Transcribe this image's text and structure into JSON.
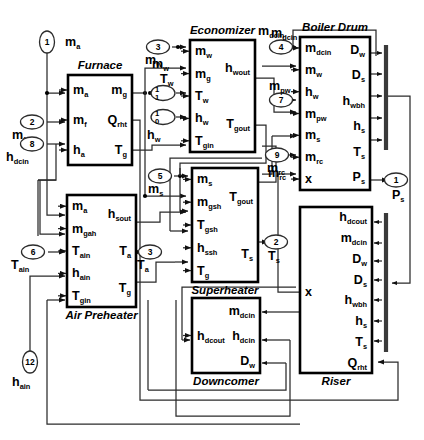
{
  "diagram": {
    "type": "block-diagram"
  },
  "blocks": [
    {
      "id": "furnace",
      "title": "Furnace",
      "title_pos": "top",
      "x": 68,
      "y": 75,
      "w": 64,
      "h": 90,
      "inputs": [
        {
          "base": "m",
          "sub": "a"
        },
        {
          "base": "m",
          "sub": "f"
        },
        {
          "base": "h",
          "sub": "a"
        }
      ],
      "outputs": [
        {
          "base": "m",
          "sub": "g"
        },
        {
          "base": "Q",
          "sub": "rht"
        },
        {
          "base": "T",
          "sub": "g"
        }
      ]
    },
    {
      "id": "air-preheater",
      "title": "Air Preheater",
      "title_pos": "bottom",
      "x": 67,
      "y": 195,
      "w": 69,
      "h": 112,
      "inputs": [
        {
          "base": "m",
          "sub": "a"
        },
        {
          "base": "m",
          "sub": "gah"
        },
        {
          "base": "T",
          "sub": "ain"
        },
        {
          "base": "h",
          "sub": "ain"
        },
        {
          "base": "T",
          "sub": "gin"
        }
      ],
      "outputs": [
        {
          "base": "h",
          "sub": "sout"
        },
        {
          "base": "T",
          "sub": "a"
        },
        {
          "base": "T",
          "sub": "g"
        }
      ]
    },
    {
      "id": "economizer",
      "title": "Economizer",
      "title_pos": "top",
      "x": 190,
      "y": 40,
      "w": 65,
      "h": 112,
      "inputs": [
        {
          "base": "m",
          "sub": "w"
        },
        {
          "base": "m",
          "sub": "g"
        },
        {
          "base": "T",
          "sub": "w"
        },
        {
          "base": "h",
          "sub": "w"
        },
        {
          "base": "T",
          "sub": "gin"
        }
      ],
      "outputs": [
        {
          "base": "h",
          "sub": "wout"
        },
        {
          "base": "T",
          "sub": "gout"
        }
      ]
    },
    {
      "id": "superheater",
      "title": "Superheater",
      "title_pos": "bottom",
      "x": 192,
      "y": 168,
      "w": 66,
      "h": 114,
      "inputs": [
        {
          "base": "m",
          "sub": "s"
        },
        {
          "base": "m",
          "sub": "gsh"
        },
        {
          "base": "T",
          "sub": "gsh"
        },
        {
          "base": "h",
          "sub": "ssh"
        },
        {
          "base": "T",
          "sub": "g"
        }
      ],
      "outputs": [
        {
          "base": "T",
          "sub": "gout"
        },
        {
          "base": "T",
          "sub": "s"
        }
      ]
    },
    {
      "id": "boiler-drum",
      "title": "Boiler Drum",
      "title_pos": "top",
      "x": 300,
      "y": 37,
      "w": 70,
      "h": 153,
      "inputs": [
        {
          "base": "m",
          "sub": "dcin"
        },
        {
          "base": "m",
          "sub": "w"
        },
        {
          "base": "h",
          "sub": "w"
        },
        {
          "base": "m",
          "sub": "pw"
        },
        {
          "base": "m",
          "sub": "s"
        },
        {
          "base": "m",
          "sub": "rc"
        },
        {
          "base": "x",
          "sub": ""
        }
      ],
      "outputs": [
        {
          "base": "D",
          "sub": "w"
        },
        {
          "base": "D",
          "sub": "s"
        },
        {
          "base": "h",
          "sub": "wbh"
        },
        {
          "base": "h",
          "sub": "s"
        },
        {
          "base": "T",
          "sub": "s"
        },
        {
          "base": "P",
          "sub": "s"
        }
      ]
    },
    {
      "id": "downcomer",
      "title": "Downcomer",
      "title_pos": "bottom",
      "x": 192,
      "y": 298,
      "w": 68,
      "h": 75,
      "inputs": [
        {
          "base": "h",
          "sub": "dcout"
        }
      ],
      "outputs": [
        {
          "base": "m",
          "sub": "dcin"
        },
        {
          "base": "h",
          "sub": "dcin"
        },
        {
          "base": "D",
          "sub": "w"
        }
      ]
    },
    {
      "id": "riser",
      "title": "Riser",
      "title_pos": "bottom",
      "x": 300,
      "y": 207,
      "w": 72,
      "h": 166,
      "inputs": [],
      "outputs": [
        {
          "base": "h",
          "sub": "dcout"
        },
        {
          "base": "m",
          "sub": "dcin"
        },
        {
          "base": "D",
          "sub": "w"
        },
        {
          "base": "D",
          "sub": "s"
        },
        {
          "base": "h",
          "sub": "wbh"
        },
        {
          "base": "h",
          "sub": "s"
        },
        {
          "base": "T",
          "sub": "s"
        },
        {
          "base": "Q",
          "sub": "rht"
        }
      ],
      "left_label": {
        "base": "x",
        "sub": ""
      }
    }
  ],
  "ports": [
    {
      "num": "1",
      "label_base": "m",
      "label_sub": "a",
      "x": 47,
      "y": 42,
      "orient": "v",
      "label_dx": 18,
      "label_dy": 4
    },
    {
      "num": "2",
      "label_base": "m",
      "label_sub": "f",
      "x": 32,
      "y": 122,
      "orient": "h",
      "label_dx": -20,
      "label_dy": 17
    },
    {
      "num": "8",
      "label_base": "h",
      "label_sub": "dcin",
      "x": 32,
      "y": 144,
      "orient": "h",
      "label_dx": -26,
      "label_dy": 17
    },
    {
      "num": "6",
      "label_base": "T",
      "label_sub": "ain",
      "x": 33,
      "y": 252,
      "orient": "h",
      "label_dx": -22,
      "label_dy": 17
    },
    {
      "num": "12",
      "label_base": "h",
      "label_sub": "ain",
      "x": 30,
      "y": 362,
      "orient": "v",
      "label_dx": -18,
      "label_dy": 24
    },
    {
      "num": "3",
      "label_base": "m",
      "label_sub": "w",
      "x": 158,
      "y": 47,
      "orient": "h",
      "label_dx": -13,
      "label_dy": 17
    },
    {
      "num": "4",
      "label_base": "m",
      "label_sub": "dcin",
      "x": 281,
      "y": 47,
      "orient": "h",
      "label_dx": -10,
      "label_dy": -10
    },
    {
      "num": "5",
      "label_base": "m",
      "label_sub": "s",
      "x": 160,
      "y": 176,
      "orient": "h",
      "label_dx": -12,
      "label_dy": 17
    },
    {
      "num": "7",
      "label_base": "m",
      "label_sub": "pw",
      "x": 281,
      "y": 100,
      "orient": "h",
      "label_dx": -12,
      "label_dy": -10
    },
    {
      "num": "9",
      "label_base": "m",
      "label_sub": "rc",
      "x": 277,
      "y": 155,
      "orient": "h",
      "label_dx": -10,
      "label_dy": 17
    },
    {
      "num": "3",
      "label_base": "T",
      "label_sub": "a",
      "x": 150,
      "y": 252,
      "orient": "h",
      "label_dx": -13,
      "label_dy": 17
    },
    {
      "num": "2",
      "label_base": "T",
      "label_sub": "s",
      "x": 276,
      "y": 242,
      "orient": "h",
      "label_dx": -8,
      "label_dy": 18
    },
    {
      "num": "1",
      "label_base": "P",
      "label_sub": "s",
      "x": 396,
      "y": 180,
      "orient": "h",
      "label_dx": -4,
      "label_dy": 19
    }
  ],
  "switches": [
    {
      "id": "sw-tw",
      "x": 163,
      "y": 93,
      "top": "1",
      "bottom": "1",
      "label_base": "T",
      "label_sub": "w",
      "label_dx": -3,
      "label_dy": -10
    },
    {
      "id": "sw-hw",
      "x": 163,
      "y": 117,
      "top": "1",
      "bottom": "0",
      "label_base": "h",
      "label_sub": "w",
      "label_dx": -16,
      "label_dy": 22
    }
  ],
  "free_labels": [
    {
      "id": "mw-econ-in",
      "base": "m",
      "sub": "w",
      "x": 152,
      "y": 68
    },
    {
      "id": "mrc-drum",
      "base": "m",
      "sub": "rc",
      "x": 268,
      "y": 177
    },
    {
      "id": "mdcin-top",
      "base": "m",
      "sub": "dcin",
      "x": 258,
      "y": 35
    }
  ],
  "buses": [
    {
      "id": "drum-output-bus",
      "x": 386,
      "y1": 45,
      "y2": 150
    },
    {
      "id": "riser-input-bus",
      "x": 386,
      "y1": 213,
      "y2": 352
    }
  ],
  "colors": {
    "block_stroke": "#000000",
    "wire": "#2b2b2b",
    "bus": "#3a3a3a",
    "background": "#ffffff"
  }
}
